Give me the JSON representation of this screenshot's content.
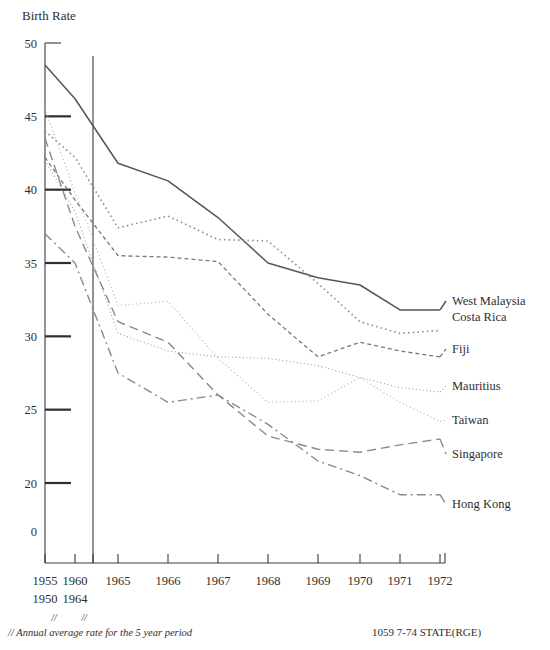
{
  "chart_data": {
    "type": "line",
    "title": "Birth Rate",
    "xlabel": "",
    "ylabel": "Birth Rate",
    "ylim": [
      18,
      50
    ],
    "grid": false,
    "legend_position": "right-inline-labels",
    "categories": [
      "1955",
      "1960",
      "1965",
      "1966",
      "1967",
      "1968",
      "1969",
      "1970",
      "1971",
      "1972"
    ],
    "x_values": [
      1955,
      1960,
      1965,
      1966,
      1967,
      1968,
      1969,
      1970,
      1971,
      1972
    ],
    "x_sub_labels": [
      "1950",
      "1964",
      "",
      "",
      "",
      "",
      "",
      "",
      "",
      ""
    ],
    "x_period_markers": [
      "//",
      "//"
    ],
    "y_ticks": [
      "50",
      "45",
      "40",
      "35",
      "30",
      "25",
      "20",
      "0"
    ],
    "y_tick_values": [
      50,
      45,
      40,
      35,
      30,
      25,
      20,
      18
    ],
    "reference_line_x": 1964,
    "series": [
      {
        "name": "West Malaysia",
        "style": "solid",
        "color": "#555555",
        "width": 1.5,
        "dash": "none",
        "label_anchor_year": 1971,
        "values": [
          48.5,
          46.2,
          41.8,
          40.6,
          38.1,
          35.0,
          34.0,
          33.5,
          31.8,
          31.8
        ]
      },
      {
        "name": "Costa Rica",
        "style": "dotted",
        "color": "#8a8a8a",
        "width": 1.6,
        "dash": "1.5,3.2",
        "label_anchor_year": 1971,
        "values": [
          44.0,
          42.2,
          37.4,
          38.2,
          36.6,
          36.5,
          33.6,
          31.0,
          30.2,
          30.4
        ]
      },
      {
        "name": "Fiji",
        "style": "dashed-short",
        "color": "#777777",
        "width": 1.3,
        "dash": "4,3",
        "label_anchor_year": 1971,
        "values": [
          42.2,
          39.3,
          35.5,
          35.4,
          35.1,
          31.5,
          28.6,
          29.6,
          29.0,
          28.6
        ]
      },
      {
        "name": "Mauritius",
        "style": "dotted-fine",
        "color": "#9b9b9b",
        "width": 1.1,
        "dash": "1,2.6",
        "label_anchor_year": 1971,
        "values": [
          42.0,
          38.5,
          30.2,
          29.0,
          28.6,
          28.5,
          28.0,
          27.2,
          26.5,
          26.2
        ]
      },
      {
        "name": "Taiwan",
        "style": "dotted-light",
        "color": "#b0b0b0",
        "width": 1.1,
        "dash": "1,2.8",
        "label_anchor_year": 1971,
        "values": [
          45.5,
          39.8,
          32.1,
          32.4,
          28.5,
          25.5,
          25.6,
          27.2,
          25.5,
          24.2
        ]
      },
      {
        "name": "Singapore",
        "style": "dashed-long",
        "color": "#8a8a8a",
        "width": 1.4,
        "dash": "9,5",
        "label_anchor_year": 1971,
        "values": [
          43.5,
          37.5,
          31.0,
          29.6,
          26.0,
          23.2,
          22.3,
          22.1,
          22.6,
          23.0
        ]
      },
      {
        "name": "Hong Kong",
        "style": "dash-dot",
        "color": "#8a8a8a",
        "width": 1.4,
        "dash": "9,4,2,4",
        "label_anchor_year": 1971,
        "values": [
          37.0,
          35.0,
          27.5,
          25.5,
          26.0,
          24.0,
          21.5,
          20.5,
          19.2,
          19.2
        ]
      }
    ]
  },
  "footnotes": {
    "period_note": "// Annual average rate for the 5 year period",
    "credit": "1059 7-74 STATE(RGE)"
  }
}
